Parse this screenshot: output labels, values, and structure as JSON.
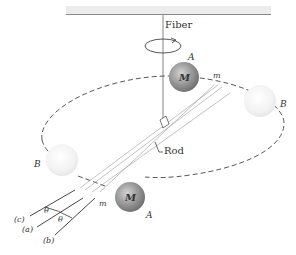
{
  "diagram": {
    "labels": {
      "fiber": "Fiber",
      "rod": "Rod",
      "large_mass_top": "M",
      "large_mass_bottom": "M",
      "pos_A_top": "A",
      "pos_A_bottom": "A",
      "pos_B_right": "B",
      "pos_B_left": "B",
      "small_mass_top": "m",
      "small_mass_bottom": "m",
      "theta_1": "θ",
      "theta_2": "θ",
      "line_c": "(c)",
      "line_a": "(a)",
      "line_b": "(b)"
    },
    "colors": {
      "ceiling": "#c8c8c8",
      "mass_A": "#8a8a8a",
      "mass_B": "#eeeeee",
      "lines": "#444444"
    }
  }
}
